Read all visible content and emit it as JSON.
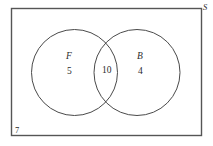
{
  "figure": {
    "type": "venn-diagram",
    "universe": {
      "label": "S",
      "outside_count": "7"
    },
    "sets": [
      {
        "id": "F",
        "label": "F",
        "only_count": "5"
      },
      {
        "id": "B",
        "label": "B",
        "only_count": "4"
      }
    ],
    "intersection": {
      "label": "10"
    },
    "colors": {
      "stroke": "#4a4a4a",
      "rectangle_stroke": "#555555",
      "background": "#ffffff",
      "text": "#2b2b2b"
    }
  }
}
